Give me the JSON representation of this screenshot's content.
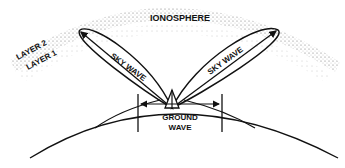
{
  "diagram": {
    "labels": {
      "ionosphere": "IONOSPHERE",
      "layer2": "LAYER 2",
      "layer1": "LAYER 1",
      "sky_wave_left": "SKY WAVE",
      "sky_wave_right": "SKY WAVE",
      "ground_wave_line1": "GROUND",
      "ground_wave_line2": "WAVE"
    },
    "colors": {
      "line": "#111111",
      "stipple": "#555555",
      "background": "#ffffff"
    }
  }
}
